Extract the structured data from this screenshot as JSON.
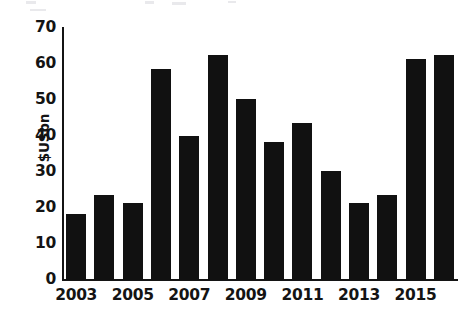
{
  "chart_data": {
    "type": "bar",
    "title": "",
    "subtitle": "",
    "xlabel": "",
    "ylabel": "$USbn",
    "categories": [
      "2003",
      "2004",
      "2005",
      "2006",
      "2007",
      "2008",
      "2009",
      "2010",
      "2011",
      "2012",
      "2013",
      "2014",
      "2015",
      "2016"
    ],
    "values": [
      18.3,
      23.5,
      21.3,
      58.5,
      40.0,
      62.5,
      50.3,
      38.3,
      43.5,
      30.3,
      21.5,
      23.5,
      61.5,
      62.5
    ],
    "ylim": [
      0,
      70
    ],
    "y_ticks": [
      0,
      10,
      20,
      30,
      40,
      50,
      60,
      70
    ],
    "y_tick_labels": [
      "0",
      "10",
      "20",
      "30",
      "40",
      "50",
      "60",
      "70"
    ],
    "x_tick_labels": [
      "2003",
      "2005",
      "2007",
      "2009",
      "2011",
      "2013",
      "2015"
    ],
    "x_tick_categories": [
      "2003",
      "2005",
      "2007",
      "2009",
      "2011",
      "2013",
      "2015"
    ],
    "grid": false,
    "legend": null,
    "legend_position": "none",
    "bar_color": "#111111",
    "axis_color": "#141414",
    "background_color": "#ffffff",
    "annotations": []
  }
}
